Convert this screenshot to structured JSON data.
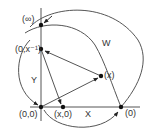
{
  "diagram": {
    "stroke_color": "#555555",
    "point_color": "#111111",
    "points": {
      "infinity": {
        "label": "(∞)",
        "x": 41,
        "y": 25
      },
      "zero_x_inv": {
        "label": "(0,x⁻¹)",
        "x": 41,
        "y": 49
      },
      "origin": {
        "label": "(0,0)",
        "x": 41,
        "y": 107
      },
      "x_zero": {
        "label": "(x,0)",
        "x": 63,
        "y": 107
      },
      "x_point": {
        "label": "(x)",
        "x": 101,
        "y": 76
      },
      "zero_point": {
        "label": "(0)",
        "x": 121,
        "y": 107
      }
    },
    "axis_labels": {
      "x": "X",
      "y": "Y",
      "w": "W"
    }
  }
}
